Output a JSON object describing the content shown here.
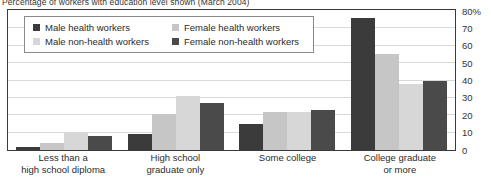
{
  "title": "Percentage of workers with education level shown (March 2004)",
  "legend": {
    "items": [
      {
        "label": "Male health workers",
        "color": "#3b3b3b",
        "swatch": "square-swatch"
      },
      {
        "label": "Female health workers",
        "color": "#c6c6c6",
        "swatch": "square-swatch"
      },
      {
        "label": "Male non-health workers",
        "color": "#d7d7d7",
        "swatch": "square-swatch"
      },
      {
        "label": "Female non-health workers",
        "color": "#4a4a4a",
        "swatch": "square-swatch"
      }
    ]
  },
  "yaxis": {
    "ticks": [
      "80%",
      "70",
      "60",
      "50",
      "40",
      "30",
      "20",
      "10",
      "0"
    ]
  },
  "xaxis": {
    "labels": [
      {
        "line1": "Less than a",
        "line2": "high school diploma"
      },
      {
        "line1": "High school",
        "line2": "graduate only"
      },
      {
        "line1": "Some college",
        "line2": ""
      },
      {
        "line1": "College graduate",
        "line2": "or more"
      }
    ]
  },
  "chart_data": {
    "type": "bar",
    "title": "Percentage of workers with education level shown (March 2004)",
    "xlabel": "",
    "ylabel": "",
    "ylim": [
      0,
      80
    ],
    "ytick_step": 10,
    "grid": true,
    "legend_position": "upper-left-inset",
    "categories": [
      "Less than a high school diploma",
      "High school graduate only",
      "Some college",
      "College graduate or more"
    ],
    "series": [
      {
        "name": "Male health workers",
        "color": "#3b3b3b",
        "values": [
          2,
          9,
          15,
          76
        ]
      },
      {
        "name": "Female health workers",
        "color": "#c6c6c6",
        "values": [
          4,
          21,
          22,
          55
        ]
      },
      {
        "name": "Male non-health workers",
        "color": "#d7d7d7",
        "values": [
          10,
          31,
          22,
          38
        ]
      },
      {
        "name": "Female non-health workers",
        "color": "#4a4a4a",
        "values": [
          8,
          27,
          23,
          40
        ]
      }
    ]
  }
}
